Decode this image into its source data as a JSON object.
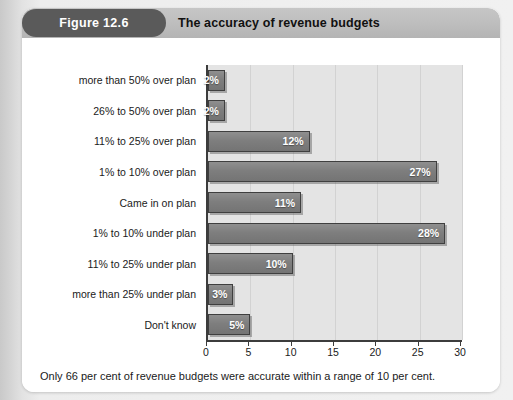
{
  "figure": {
    "badge_label": "Figure 12.6",
    "title": "The accuracy of revenue budgets",
    "caption": "Only 66 per cent of revenue budgets were accurate within a range of 10 per cent.",
    "badge_color": "#5a5a5a",
    "header_color": "#bdbdbd",
    "bar_color": "#7e7e7e",
    "plot_background": "#e4e4e4",
    "axis_color": "#3c3c3c"
  },
  "chart_data": {
    "type": "bar",
    "orientation": "horizontal",
    "title": "The accuracy of revenue budgets",
    "xlabel": "%",
    "ylabel": "",
    "xlim": [
      0,
      30
    ],
    "xticks": [
      0,
      5,
      10,
      15,
      20,
      25,
      30
    ],
    "xtick_labels": [
      "0",
      "5",
      "10",
      "15",
      "20",
      "25",
      "30"
    ],
    "grid": true,
    "legend": false,
    "categories": [
      "more than 50% over plan",
      "26% to 50% over plan",
      "11% to 25% over plan",
      "1% to 10% over plan",
      "Came in on plan",
      "1% to 10% under plan",
      "11% to 25% under plan",
      "more than 25% under plan",
      "Don't know"
    ],
    "values": [
      2,
      2,
      12,
      27,
      11,
      28,
      10,
      3,
      5
    ],
    "data_labels": [
      "2%",
      "2%",
      "12%",
      "27%",
      "11%",
      "28%",
      "10%",
      "3%",
      "5%"
    ]
  }
}
